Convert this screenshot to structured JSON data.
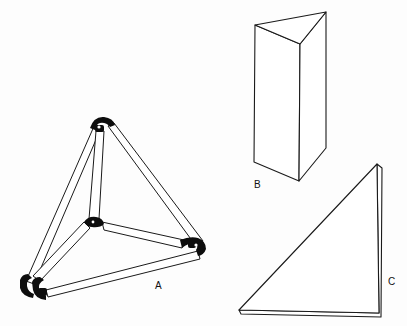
{
  "figure": {
    "width": 407,
    "height": 326,
    "background": "#fdfdfd",
    "ink": "#1a1a1a"
  },
  "labels": {
    "a": "A",
    "b": "B",
    "c": "C"
  },
  "shapes": {
    "tetrahedron_frame": {
      "label": "A",
      "vertices": {
        "top": [
          100,
          122
        ],
        "bottom_left": [
          30,
          286
        ],
        "center": [
          92,
          223
        ],
        "right": [
          200,
          247
        ]
      },
      "bars": [
        {
          "from": "top",
          "to": "bottom_left"
        },
        {
          "from": "top",
          "to": "center"
        },
        {
          "from": "top",
          "to": "right"
        },
        {
          "from": "center",
          "to": "bottom_left"
        },
        {
          "from": "center",
          "to": "right"
        },
        {
          "from": "bottom_left",
          "to": "right"
        }
      ]
    },
    "triangular_prism": {
      "label": "B",
      "top": [
        [
          255,
          25
        ],
        [
          326,
          12
        ],
        [
          300,
          44
        ]
      ],
      "bottom": [
        [
          254,
          162
        ],
        [
          326,
          148
        ],
        [
          299,
          181
        ]
      ]
    },
    "triangle_plate": {
      "label": "C",
      "vertices": [
        [
          377,
          164
        ],
        [
          239,
          310
        ],
        [
          379,
          313
        ]
      ]
    }
  }
}
